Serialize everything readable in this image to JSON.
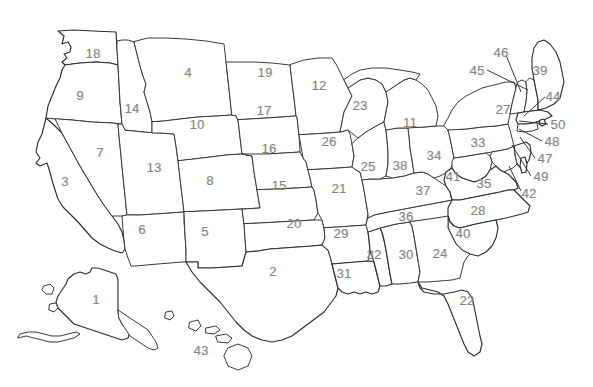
{
  "map": {
    "title": "United States Numbered States Map",
    "background_color": "#ffffff",
    "outline_color": "#3a3a3a",
    "label_color": "#848484",
    "label_font_size": 13,
    "width": 593,
    "height": 387,
    "labels": [
      {
        "id": "alaska",
        "text": "1",
        "x": 96,
        "y": 299
      },
      {
        "id": "texas",
        "text": "2",
        "x": 273,
        "y": 271
      },
      {
        "id": "california",
        "text": "3",
        "x": 65,
        "y": 181
      },
      {
        "id": "montana",
        "text": "4",
        "x": 188,
        "y": 72
      },
      {
        "id": "new-mexico",
        "text": "5",
        "x": 205,
        "y": 231
      },
      {
        "id": "arizona",
        "text": "6",
        "x": 142,
        "y": 229
      },
      {
        "id": "nevada",
        "text": "7",
        "x": 100,
        "y": 152
      },
      {
        "id": "colorado",
        "text": "8",
        "x": 210,
        "y": 180
      },
      {
        "id": "oregon",
        "text": "9",
        "x": 80,
        "y": 95
      },
      {
        "id": "wyoming",
        "text": "10",
        "x": 197,
        "y": 124
      },
      {
        "id": "michigan",
        "text": "11",
        "x": 410,
        "y": 122
      },
      {
        "id": "minnesota",
        "text": "12",
        "x": 319,
        "y": 85
      },
      {
        "id": "utah",
        "text": "13",
        "x": 154,
        "y": 167
      },
      {
        "id": "idaho",
        "text": "14",
        "x": 132,
        "y": 108
      },
      {
        "id": "kansas",
        "text": "15",
        "x": 279,
        "y": 185
      },
      {
        "id": "nebraska",
        "text": "16",
        "x": 269,
        "y": 148
      },
      {
        "id": "south-dakota",
        "text": "17",
        "x": 264,
        "y": 110
      },
      {
        "id": "washington",
        "text": "18",
        "x": 93,
        "y": 53
      },
      {
        "id": "north-dakota",
        "text": "19",
        "x": 265,
        "y": 72
      },
      {
        "id": "oklahoma",
        "text": "20",
        "x": 294,
        "y": 223
      },
      {
        "id": "missouri",
        "text": "21",
        "x": 339,
        "y": 188
      },
      {
        "id": "florida",
        "text": "22",
        "x": 467,
        "y": 300
      },
      {
        "id": "wisconsin",
        "text": "23",
        "x": 360,
        "y": 105
      },
      {
        "id": "georgia",
        "text": "24",
        "x": 440,
        "y": 253
      },
      {
        "id": "illinois",
        "text": "25",
        "x": 368,
        "y": 166
      },
      {
        "id": "iowa",
        "text": "26",
        "x": 329,
        "y": 141
      },
      {
        "id": "new-york",
        "text": "27",
        "x": 503,
        "y": 109
      },
      {
        "id": "north-carolina",
        "text": "28",
        "x": 478,
        "y": 210
      },
      {
        "id": "arkansas",
        "text": "29",
        "x": 341,
        "y": 233
      },
      {
        "id": "alabama",
        "text": "30",
        "x": 406,
        "y": 254
      },
      {
        "id": "louisiana",
        "text": "31",
        "x": 344,
        "y": 273
      },
      {
        "id": "mississippi",
        "text": "32",
        "x": 374,
        "y": 254
      },
      {
        "id": "pennsylvania",
        "text": "33",
        "x": 478,
        "y": 142
      },
      {
        "id": "ohio",
        "text": "34",
        "x": 434,
        "y": 155
      },
      {
        "id": "virginia",
        "text": "35",
        "x": 484,
        "y": 183
      },
      {
        "id": "tennessee",
        "text": "36",
        "x": 406,
        "y": 216
      },
      {
        "id": "kentucky",
        "text": "37",
        "x": 423,
        "y": 190
      },
      {
        "id": "indiana",
        "text": "38",
        "x": 400,
        "y": 165
      },
      {
        "id": "maine",
        "text": "39",
        "x": 540,
        "y": 70
      },
      {
        "id": "south-carolina",
        "text": "40",
        "x": 463,
        "y": 233
      },
      {
        "id": "west-virginia",
        "text": "41",
        "x": 453,
        "y": 176
      },
      {
        "id": "delaware",
        "text": "42",
        "x": 529,
        "y": 193
      },
      {
        "id": "hawaii",
        "text": "43",
        "x": 201,
        "y": 350
      },
      {
        "id": "new-hampshire",
        "text": "44",
        "x": 553,
        "y": 96
      },
      {
        "id": "vermont",
        "text": "45",
        "x": 477,
        "y": 70
      },
      {
        "id": "vermont-alt",
        "text": "46",
        "x": 501,
        "y": 52
      },
      {
        "id": "new-jersey",
        "text": "47",
        "x": 545,
        "y": 158
      },
      {
        "id": "connecticut",
        "text": "48",
        "x": 552,
        "y": 141
      },
      {
        "id": "maryland",
        "text": "49",
        "x": 541,
        "y": 176
      },
      {
        "id": "rhode-island",
        "text": "50",
        "x": 558,
        "y": 124
      }
    ]
  }
}
